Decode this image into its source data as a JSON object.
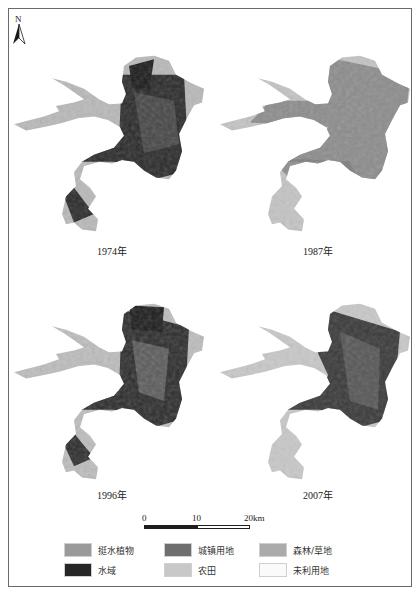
{
  "figure": {
    "north_arrow": {
      "label": "N",
      "icon": "north-arrow-icon"
    },
    "maps": [
      {
        "year_label": "1974年",
        "dominant": "水域"
      },
      {
        "year_label": "1987年",
        "dominant": "城镇用地"
      },
      {
        "year_label": "1996年",
        "dominant": "水域"
      },
      {
        "year_label": "2007年",
        "dominant": "农田"
      }
    ],
    "scale_bar": {
      "ticks": [
        "0",
        "10",
        "20km"
      ]
    },
    "legend": [
      {
        "label": "挺水植物",
        "color": "#9a9a9a"
      },
      {
        "label": "城镇用地",
        "color": "#6e6e6e"
      },
      {
        "label": "森林/草地",
        "color": "#ababab"
      },
      {
        "label": "水域",
        "color": "#262626"
      },
      {
        "label": "农田",
        "color": "#c8c8c8"
      },
      {
        "label": "未利用地",
        "color": "#fafafa"
      }
    ]
  }
}
